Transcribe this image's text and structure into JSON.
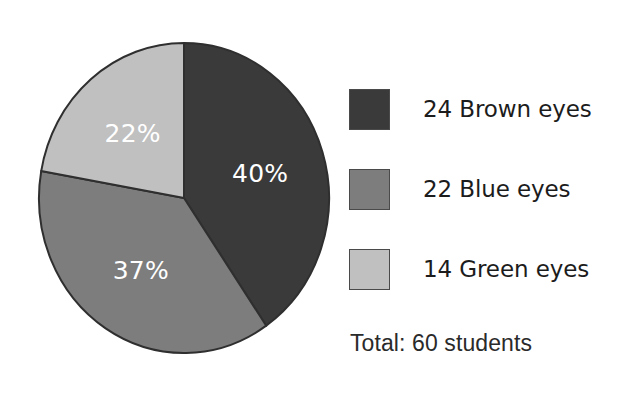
{
  "chart_data": {
    "type": "pie",
    "title": "",
    "categories": [
      "Brown eyes",
      "Blue eyes",
      "Green eyes"
    ],
    "values": [
      24,
      22,
      14
    ],
    "percent_labels": [
      "40%",
      "37%",
      "22%"
    ],
    "percents": [
      40,
      37,
      22
    ],
    "colors": [
      "#3a3a3a",
      "#7d7d7d",
      "#c0c0c0"
    ],
    "slice_label_color": "#ffffff",
    "start_angle_deg": 0,
    "direction": "clockwise",
    "legend": {
      "position": "right",
      "entries": [
        {
          "label": "24 Brown eyes",
          "count": 24,
          "category": "Brown eyes",
          "color": "#3a3a3a"
        },
        {
          "label": "22 Blue eyes",
          "count": 22,
          "category": "Blue eyes",
          "color": "#7d7d7d"
        },
        {
          "label": "14 Green eyes",
          "count": 14,
          "category": "Green eyes",
          "color": "#c0c0c0"
        }
      ]
    },
    "total": {
      "text": "Total:  60 students",
      "value": 60,
      "unit": "students"
    },
    "grid": false,
    "xlabel": "",
    "ylabel": ""
  },
  "pie": {
    "slices": [
      {
        "name": "brown",
        "label": "40%",
        "label_x": 212,
        "label_y": 165,
        "color": "#3a3a3a",
        "path": "M 148 158 L 148 3 A 145 155 0 0 1 230 296 Z"
      },
      {
        "name": "blue",
        "label": "37%",
        "label_x": 77,
        "label_y": 244,
        "color": "#7d7d7d",
        "path": "M 148 158 L 230 296 A 145 155 0 0 1 3 136 Z"
      },
      {
        "name": "green",
        "label": "22%",
        "label_x": 74,
        "label_y": 90,
        "color": "#c0c0c0",
        "path": "M 148 158 L 3 136 A 145 155 0 0 1 148 3 Z"
      }
    ],
    "outline_color": "#2f2f2f"
  }
}
